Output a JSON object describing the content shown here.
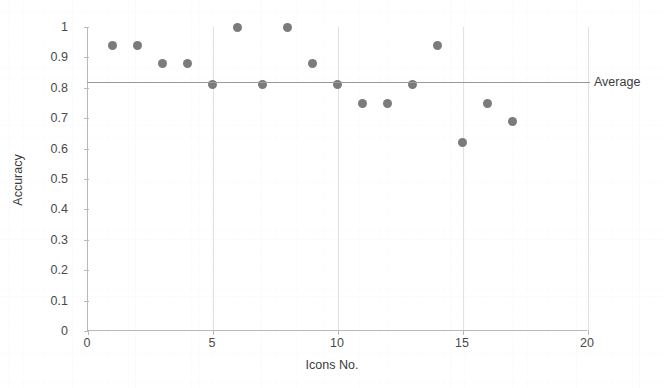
{
  "chart_data": {
    "type": "scatter",
    "title": "",
    "xlabel": "Icons No.",
    "ylabel": "Accuracy",
    "xlim": [
      0,
      20
    ],
    "ylim": [
      0,
      1
    ],
    "xticks": [
      "0",
      "5",
      "10",
      "15",
      "20"
    ],
    "xtick_values": [
      0,
      5,
      10,
      15,
      20
    ],
    "yticks": [
      "0",
      "0.1",
      "0.2",
      "0.3",
      "0.4",
      "0.5",
      "0.6",
      "0.7",
      "0.8",
      "0.9",
      "1"
    ],
    "ytick_values": [
      0,
      0.1,
      0.2,
      0.3,
      0.4,
      0.5,
      0.6,
      0.7,
      0.8,
      0.9,
      1
    ],
    "grid": "vertical-faint",
    "legend": "none",
    "marker_color": "#7b7b7b",
    "annotations": [
      {
        "name": "average-line",
        "label": "Average",
        "type": "hline",
        "value": 0.82
      }
    ],
    "x": [
      1,
      2,
      3,
      4,
      5,
      6,
      7,
      8,
      9,
      10,
      11,
      12,
      13,
      14,
      15,
      16,
      17
    ],
    "values": [
      0.94,
      0.94,
      0.88,
      0.88,
      0.81,
      1.0,
      0.81,
      1.0,
      0.88,
      0.81,
      0.75,
      0.75,
      0.81,
      0.94,
      0.62,
      0.75,
      0.69
    ],
    "points": [
      {
        "x": 1,
        "y": 0.94
      },
      {
        "x": 2,
        "y": 0.94
      },
      {
        "x": 3,
        "y": 0.88
      },
      {
        "x": 4,
        "y": 0.88
      },
      {
        "x": 5,
        "y": 0.81
      },
      {
        "x": 6,
        "y": 1.0
      },
      {
        "x": 7,
        "y": 0.81
      },
      {
        "x": 8,
        "y": 1.0
      },
      {
        "x": 9,
        "y": 0.88
      },
      {
        "x": 10,
        "y": 0.81
      },
      {
        "x": 11,
        "y": 0.75
      },
      {
        "x": 12,
        "y": 0.75
      },
      {
        "x": 13,
        "y": 0.81
      },
      {
        "x": 14,
        "y": 0.94
      },
      {
        "x": 15,
        "y": 0.62
      },
      {
        "x": 16,
        "y": 0.75
      },
      {
        "x": 17,
        "y": 0.69
      }
    ]
  }
}
